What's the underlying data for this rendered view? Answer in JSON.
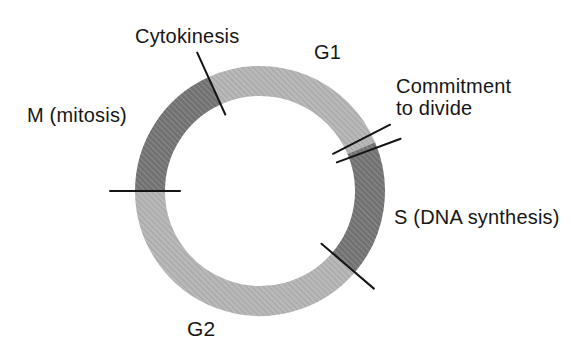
{
  "figure": {
    "name": "cell-cycle-diagram",
    "background": "#ffffff",
    "text_color": "#161616",
    "labels": {
      "cytokinesis": {
        "text": "Cytokinesis"
      },
      "g1": {
        "text": "G1"
      },
      "commitment_line1": {
        "text": "Commitment"
      },
      "commitment_line2": {
        "text": "to divide"
      },
      "s": {
        "text": "S (DNA synthesis)"
      },
      "g2": {
        "text": "G2"
      },
      "m": {
        "text": "M (mitosis)"
      }
    },
    "ring": {
      "center_x": 260,
      "center_y": 191,
      "radius": 110,
      "thickness": 30,
      "colors": {
        "light": "#b9b9b9",
        "light_hatch": "#a5a5a5",
        "dark": "#717171",
        "dark_hatch": "#8a8a8a",
        "tick": "#141414"
      },
      "segments": [
        {
          "name": "G1",
          "shade": "light",
          "start_deg": -24.5,
          "end_deg": 67
        },
        {
          "name": "S",
          "shade": "dark",
          "start_deg": 67,
          "end_deg": 130.6
        },
        {
          "name": "G2",
          "shade": "light",
          "start_deg": 130.6,
          "end_deg": 270
        },
        {
          "name": "M",
          "shade": "dark",
          "start_deg": 270,
          "end_deg": 335.5
        }
      ],
      "ticks": [
        {
          "name": "cytokinesis-boundary-tick",
          "angle_deg": -24.4,
          "r_inner": 84,
          "r_outer": 152
        },
        {
          "name": "commitment-tick-1",
          "angle_deg": 63,
          "r_inner": 82,
          "r_outer": 146
        },
        {
          "name": "commitment-tick-2",
          "angle_deg": 69.6,
          "r_inner": 82,
          "r_outer": 150
        },
        {
          "name": "s-g2-boundary-tick",
          "angle_deg": 130.6,
          "r_inner": 81,
          "r_outer": 150
        },
        {
          "name": "g2-m-boundary-tick",
          "angle_deg": 270,
          "r_inner": 80,
          "r_outer": 150
        }
      ]
    }
  }
}
